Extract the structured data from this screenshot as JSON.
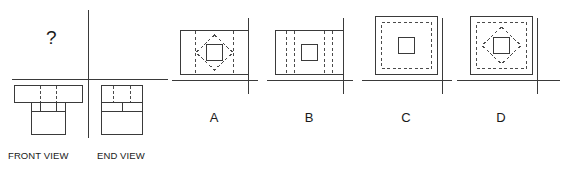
{
  "question": {
    "prompt_symbol": "?",
    "given_views": [
      {
        "id": "front",
        "label": "FRONT VIEW"
      },
      {
        "id": "end",
        "label": "END VIEW"
      }
    ],
    "missing_view": "top",
    "colors": {
      "visible_line": "#3a3a3a",
      "hidden_line": "#4a4a4a",
      "axis_line": "#3a3a3a",
      "text": "#1a1a1a",
      "background": "#ffffff"
    }
  },
  "options": [
    {
      "letter": "A",
      "outline_shape": "wide-rectangle",
      "features": [
        "two-dashed-vertical-lines",
        "dashed-diamond",
        "solid-center-square"
      ]
    },
    {
      "letter": "B",
      "outline_shape": "wide-rectangle",
      "features": [
        "four-dashed-vertical-lines",
        "solid-center-square"
      ]
    },
    {
      "letter": "C",
      "outline_shape": "square",
      "features": [
        "dashed-inner-square",
        "solid-center-square"
      ]
    },
    {
      "letter": "D",
      "outline_shape": "square",
      "features": [
        "dashed-inner-square",
        "dashed-diamond",
        "solid-center-square"
      ]
    }
  ]
}
